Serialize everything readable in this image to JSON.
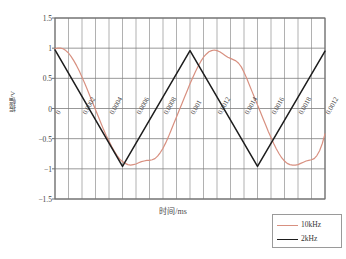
{
  "chart_data": {
    "type": "line",
    "title": "",
    "xlabel": "时间/ms",
    "ylabel": "振幅/V",
    "xlim": [
      0,
      0.002
    ],
    "ylim": [
      -1.5,
      1.5
    ],
    "grid": true,
    "legend_position": "bottom-right",
    "y_ticks": [
      "1.5",
      "1",
      "0.5",
      "0",
      "-0.5",
      "-1",
      "-1.5"
    ],
    "y_tick_values": [
      1.5,
      1,
      0.5,
      0,
      -0.5,
      -1,
      -1.5
    ],
    "x_ticks": [
      "0",
      "0.0002",
      "0.0004",
      "0.0006",
      "0.0008",
      "0.001",
      "0.0012",
      "0.0014",
      "0.0016",
      "0.0018",
      "0.0012"
    ],
    "x_tick_values": [
      0,
      0.0002,
      0.0004,
      0.0006,
      0.0008,
      0.001,
      0.0012,
      0.0014,
      0.0016,
      0.0018,
      0.002
    ],
    "minor_x_divisions": 20,
    "series": [
      {
        "name": "10kHz",
        "color": "#d89080",
        "description": "smoothed sine-like reconstruction, amplitude 1 V, 2 periods over 0-0.002 ms",
        "x": [
          0,
          2e-05,
          4e-05,
          6e-05,
          8e-05,
          0.0001,
          0.00012,
          0.00014,
          0.00016,
          0.00018,
          0.0002,
          0.00022,
          0.00024,
          0.00026,
          0.00028,
          0.0003,
          0.00032,
          0.00034,
          0.00036,
          0.00038,
          0.0004,
          0.00042,
          0.00044,
          0.00046,
          0.00048,
          0.0005,
          0.00052,
          0.00054,
          0.00056,
          0.00058,
          0.0006,
          0.00062,
          0.00064,
          0.00066,
          0.00068,
          0.0007,
          0.00072,
          0.00074,
          0.00076,
          0.00078,
          0.0008,
          0.00082,
          0.00084,
          0.00086,
          0.00088,
          0.0009,
          0.00092,
          0.00094,
          0.00096,
          0.00098,
          0.001,
          0.00102,
          0.00104,
          0.00106,
          0.00108,
          0.0011,
          0.00112,
          0.00114,
          0.00116,
          0.00118,
          0.0012,
          0.00122,
          0.00124,
          0.00126,
          0.00128,
          0.0013,
          0.00132,
          0.00134,
          0.00136,
          0.00138,
          0.0014,
          0.00142,
          0.00144,
          0.00146,
          0.00148,
          0.0015,
          0.00152,
          0.00154,
          0.00156,
          0.00158,
          0.0016,
          0.00162,
          0.00164,
          0.00166,
          0.00168,
          0.0017,
          0.00172,
          0.00174,
          0.00176,
          0.00178,
          0.0018,
          0.00182,
          0.00184,
          0.00186,
          0.00188,
          0.0019,
          0.00192,
          0.00194,
          0.00196,
          0.00198,
          0.002
        ],
        "y": [
          0.99,
          1.0,
          1.0,
          0.99,
          0.96,
          0.92,
          0.86,
          0.79,
          0.71,
          0.62,
          0.52,
          0.42,
          0.31,
          0.2,
          0.09,
          -0.02,
          -0.13,
          -0.24,
          -0.35,
          -0.45,
          -0.54,
          -0.63,
          -0.71,
          -0.78,
          -0.84,
          -0.88,
          -0.91,
          -0.93,
          -0.94,
          -0.93,
          -0.92,
          -0.9,
          -0.88,
          -0.87,
          -0.86,
          -0.86,
          -0.85,
          -0.83,
          -0.79,
          -0.73,
          -0.66,
          -0.57,
          -0.47,
          -0.36,
          -0.25,
          -0.14,
          -0.03,
          0.08,
          0.19,
          0.3,
          0.41,
          0.51,
          0.61,
          0.7,
          0.78,
          0.85,
          0.9,
          0.94,
          0.96,
          0.97,
          0.96,
          0.94,
          0.91,
          0.88,
          0.85,
          0.83,
          0.81,
          0.79,
          0.75,
          0.69,
          0.6,
          0.5,
          0.39,
          0.28,
          0.17,
          0.06,
          -0.05,
          -0.16,
          -0.27,
          -0.38,
          -0.48,
          -0.58,
          -0.67,
          -0.75,
          -0.82,
          -0.87,
          -0.91,
          -0.93,
          -0.94,
          -0.94,
          -0.93,
          -0.91,
          -0.89,
          -0.87,
          -0.86,
          -0.85,
          -0.83,
          -0.78,
          -0.7,
          -0.58,
          -0.42
        ]
      },
      {
        "name": "2kHz",
        "color": "#1d1d1d",
        "description": "triangle wave, amplitude 1 V, 2 periods over 0-0.002 ms",
        "x": [
          0,
          0.0005,
          0.001,
          0.0015,
          0.002
        ],
        "y": [
          0.97,
          -0.96,
          0.96,
          -0.96,
          0.95
        ]
      }
    ]
  },
  "legend": {
    "items": [
      {
        "label": "10kHz",
        "color": "#d89080"
      },
      {
        "label": "2kHz",
        "color": "#1d1d1d"
      }
    ]
  },
  "axes": {
    "x_title": "时间/ms",
    "y_title": "振幅/V"
  }
}
